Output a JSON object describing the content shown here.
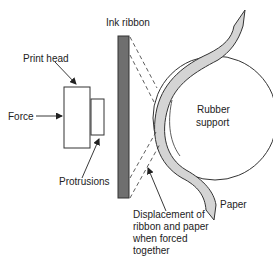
{
  "diagram": {
    "labels": {
      "ink_ribbon": "Ink ribbon",
      "print_head": "Print head",
      "force": "Force",
      "protrusions": "Protrusions",
      "rubber_support_line1": "Rubber",
      "rubber_support_line2": "support",
      "paper": "Paper",
      "displacement_line1": "Displacement of",
      "displacement_line2": "ribbon and paper",
      "displacement_line3": "when forced",
      "displacement_line4": "together"
    },
    "colors": {
      "ribbon_fill": "#6f6f6f",
      "paper_fill": "#d4d4d4",
      "stroke": "#333333",
      "background": "#ffffff"
    }
  }
}
